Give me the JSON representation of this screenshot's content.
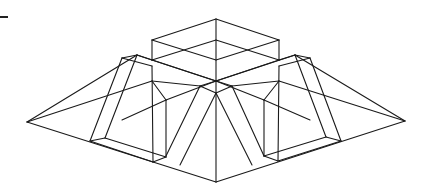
{
  "figure": {
    "stroke_color": "#1a1a1a",
    "background": "#ffffff",
    "vertices": {
      "left_corner": [
        27,
        122
      ],
      "right_corner": [
        405,
        121
      ],
      "bottom_corner": [
        216,
        182
      ],
      "apex_box_top": [
        216,
        19
      ],
      "box_left_top": [
        152,
        40
      ],
      "box_right_top": [
        279,
        40
      ],
      "box_left_bottom": [
        152,
        60
      ],
      "box_right_bottom": [
        279,
        60
      ],
      "box_front_top": [
        216,
        60
      ],
      "box_front_bottom": [
        216,
        81
      ],
      "back_center": [
        216,
        40
      ]
    },
    "segments": [
      [
        27,
        122,
        216,
        182
      ],
      [
        216,
        182,
        405,
        121
      ],
      [
        27,
        122,
        137,
        55
      ],
      [
        27,
        122,
        152,
        81
      ],
      [
        405,
        121,
        295,
        55
      ],
      [
        405,
        121,
        279,
        81
      ],
      [
        216,
        19,
        152,
        40
      ],
      [
        216,
        19,
        279,
        40
      ],
      [
        152,
        40,
        152,
        60
      ],
      [
        279,
        40,
        279,
        60
      ],
      [
        152,
        40,
        216,
        60
      ],
      [
        279,
        40,
        216,
        60
      ],
      [
        216,
        19,
        216,
        182
      ],
      [
        152,
        60,
        216,
        81
      ],
      [
        279,
        60,
        216,
        81
      ],
      [
        152,
        60,
        216,
        40
      ],
      [
        279,
        60,
        216,
        40
      ],
      [
        137,
        55,
        152,
        60
      ],
      [
        137,
        55,
        122,
        58
      ],
      [
        122,
        58,
        152,
        66
      ],
      [
        295,
        55,
        279,
        60
      ],
      [
        295,
        55,
        310,
        58
      ],
      [
        310,
        58,
        279,
        66
      ],
      [
        122,
        58,
        90,
        141
      ],
      [
        137,
        55,
        105,
        138
      ],
      [
        310,
        58,
        341,
        141
      ],
      [
        295,
        55,
        326,
        137
      ],
      [
        90,
        141,
        153,
        162
      ],
      [
        105,
        138,
        166,
        157
      ],
      [
        90,
        141,
        105,
        138
      ],
      [
        341,
        141,
        278,
        161
      ],
      [
        326,
        137,
        264,
        156
      ],
      [
        341,
        141,
        326,
        137
      ],
      [
        153,
        162,
        166,
        157
      ],
      [
        278,
        161,
        264,
        156
      ],
      [
        152,
        66,
        153,
        162
      ],
      [
        166,
        100,
        166,
        157
      ],
      [
        279,
        66,
        278,
        161
      ],
      [
        264,
        100,
        264,
        156
      ],
      [
        216,
        81,
        200,
        86
      ],
      [
        216,
        81,
        232,
        86
      ],
      [
        200,
        86,
        216,
        93
      ],
      [
        232,
        86,
        216,
        93
      ],
      [
        200,
        86,
        166,
        156
      ],
      [
        216,
        93,
        180,
        165
      ],
      [
        232,
        86,
        264,
        156
      ],
      [
        216,
        93,
        252,
        165
      ],
      [
        152,
        81,
        200,
        86
      ],
      [
        279,
        81,
        232,
        86
      ],
      [
        166,
        100,
        216,
        81
      ],
      [
        264,
        100,
        216,
        81
      ],
      [
        152,
        81,
        166,
        100
      ],
      [
        279,
        81,
        264,
        100
      ],
      [
        166,
        100,
        122,
        120
      ],
      [
        264,
        100,
        310,
        120
      ],
      [
        137,
        55,
        216,
        81
      ],
      [
        295,
        55,
        216,
        81
      ]
    ],
    "corner_mark": {
      "x": 0,
      "y": 16,
      "w": 8,
      "h": 2
    }
  }
}
